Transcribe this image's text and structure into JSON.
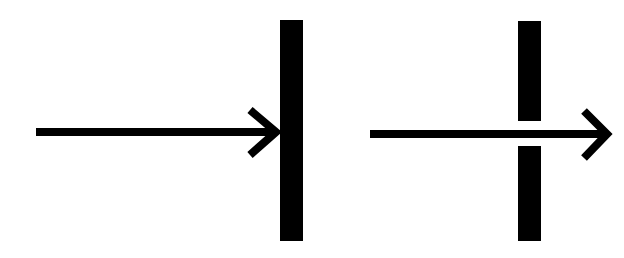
{
  "diagram": {
    "colors": {
      "background": "#ffffff",
      "ink": "#000000"
    },
    "panels": [
      {
        "name": "blocked",
        "arrow": {
          "x1": 36,
          "x2": 276,
          "y": 132,
          "head_tip": [
            278,
            132
          ],
          "head_top": [
            248,
            108
          ],
          "head_bottom": [
            248,
            158
          ]
        },
        "barrier": {
          "segments": [
            {
              "x": 280,
              "y": 20,
              "w": 23,
              "h": 221
            }
          ]
        }
      },
      {
        "name": "pass-through",
        "arrow": {
          "x1": 370,
          "x2": 608,
          "y": 134,
          "head_tip": [
            611,
            134
          ],
          "head_top": [
            582,
            109
          ],
          "head_bottom": [
            582,
            160
          ]
        },
        "barrier": {
          "segments": [
            {
              "x": 518,
              "y": 21,
              "w": 23,
              "h": 100
            },
            {
              "x": 518,
              "y": 146,
              "w": 23,
              "h": 95
            }
          ]
        }
      }
    ]
  }
}
